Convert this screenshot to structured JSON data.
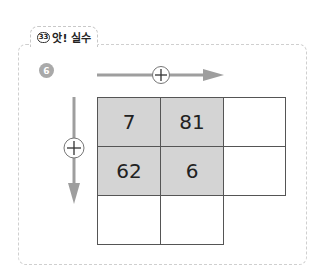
{
  "header": {
    "tab_badge": "33",
    "tab_label": "앗! 실수"
  },
  "problem": {
    "number": "6",
    "horizontal_operator": "+",
    "vertical_operator": "+",
    "grid": {
      "rows": [
        [
          "7",
          "81",
          ""
        ],
        [
          "62",
          "6",
          ""
        ],
        [
          "",
          "",
          null
        ]
      ],
      "shaded_cells": [
        [
          0,
          0
        ],
        [
          0,
          1
        ],
        [
          1,
          0
        ],
        [
          1,
          1
        ]
      ]
    }
  },
  "colors": {
    "arrow": "#9e9e9e",
    "shaded_cell": "#d4d4d4",
    "badge": "#a9a9a9",
    "dashed_border": "#cfcfcf"
  }
}
